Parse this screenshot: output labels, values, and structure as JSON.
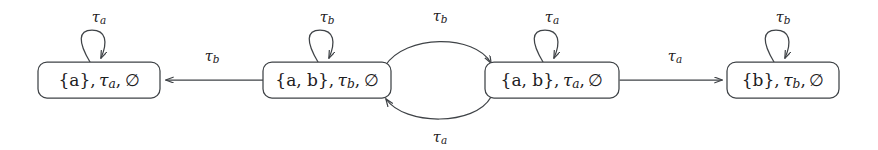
{
  "diagram": {
    "type": "state-transition-diagram",
    "title": "",
    "nodes": [
      {
        "id": "n1",
        "label": "{a}, τa, ∅",
        "set": "{a}",
        "tau": "τ",
        "tau_sub": "a",
        "empty": "∅",
        "x": 99,
        "y": 80,
        "width": 122,
        "height": 36
      },
      {
        "id": "n2",
        "label": "{a, b}, τb, ∅",
        "set": "{a, b}",
        "tau": "τ",
        "tau_sub": "b",
        "empty": "∅",
        "x": 327,
        "y": 80,
        "width": 128,
        "height": 36
      },
      {
        "id": "n3",
        "label": "{a, b}, τa, ∅",
        "set": "{a, b}",
        "tau": "τ",
        "tau_sub": "a",
        "empty": "∅",
        "x": 552,
        "y": 80,
        "width": 134,
        "height": 36
      },
      {
        "id": "n4",
        "label": "{b}, τb, ∅",
        "set": "{b}",
        "tau": "τ",
        "tau_sub": "b",
        "empty": "∅",
        "x": 783,
        "y": 80,
        "width": 112,
        "height": 36
      }
    ],
    "self_loops": [
      {
        "id": "loop1",
        "node": "n1",
        "label": "τ",
        "sub": "a",
        "label_x": 99,
        "label_y": 18
      },
      {
        "id": "loop2",
        "node": "n2",
        "label": "τ",
        "sub": "b",
        "label_x": 327,
        "label_y": 18
      },
      {
        "id": "loop3",
        "node": "n3",
        "label": "τ",
        "sub": "a",
        "label_x": 552,
        "label_y": 18
      },
      {
        "id": "loop4",
        "node": "n4",
        "label": "τ",
        "sub": "b",
        "label_x": 783,
        "label_y": 18
      }
    ],
    "edges": [
      {
        "id": "e1",
        "from": "n2",
        "to": "n1",
        "label": "τ",
        "sub": "b",
        "direction": "left",
        "shape": "straight",
        "label_x": 212,
        "label_y": 57
      },
      {
        "id": "e2",
        "from": "n2",
        "to": "n3",
        "label": "τ",
        "sub": "b",
        "direction": "right",
        "shape": "curve-up",
        "label_x": 440,
        "label_y": 17
      },
      {
        "id": "e3",
        "from": "n3",
        "to": "n2",
        "label": "τ",
        "sub": "a",
        "direction": "left",
        "shape": "curve-down",
        "label_x": 440,
        "label_y": 138
      },
      {
        "id": "e4",
        "from": "n3",
        "to": "n4",
        "label": "τ",
        "sub": "a",
        "direction": "right",
        "shape": "straight",
        "label_x": 675,
        "label_y": 57
      }
    ],
    "colors": {
      "stroke": "#3f4347",
      "text": "#1d2022",
      "background": "#ffffff"
    }
  }
}
